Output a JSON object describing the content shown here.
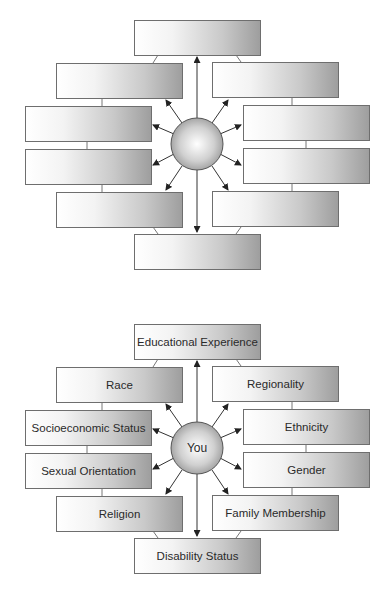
{
  "diagrams": [
    {
      "id": "blank",
      "center_label": "",
      "boxes": {
        "top": "",
        "left1": "",
        "right1": "",
        "left2": "",
        "right2": "",
        "left3": "",
        "right3": "",
        "left4": "",
        "right4": "",
        "bottom": ""
      }
    },
    {
      "id": "labeled",
      "center_label": "You",
      "boxes": {
        "top": "Educational Experience",
        "left1": "Race",
        "right1": "Regionality",
        "left2": "Socioeconomic Status",
        "right2": "Ethnicity",
        "left3": "Sexual Orientation",
        "right3": "Gender",
        "left4": "Religion",
        "right4": "Family Membership",
        "bottom": "Disability Status"
      }
    }
  ],
  "colors": {
    "border": "#6e6e6e",
    "gradient_light": "#ffffff",
    "gradient_dark": "#9e9e9e",
    "text": "#2a2a2a"
  }
}
